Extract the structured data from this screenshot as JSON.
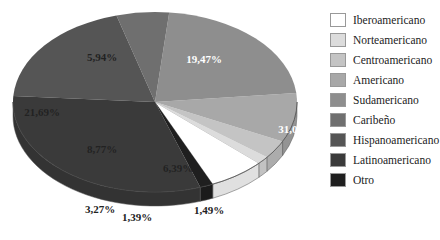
{
  "chart_data": {
    "type": "pie",
    "style": "3d",
    "title": "",
    "categories": [
      "Iberoamericano",
      "Norteamericano",
      "Centroamericano",
      "Americano",
      "Sudamericano",
      "Caribeño",
      "Hispanoamericano",
      "Latinoamericano",
      "Otro"
    ],
    "values": [
      6.39,
      1.39,
      3.27,
      8.77,
      21.69,
      5.94,
      19.47,
      31.05,
      1.49
    ],
    "labels": [
      "6,39%",
      "1,39%",
      "3,27%",
      "8,77%",
      "21,69%",
      "5,94%",
      "19,47%",
      "31,05%",
      "1,49%"
    ],
    "colors": [
      "#ffffff",
      "#dcdcdc",
      "#c4c4c4",
      "#a8a8a8",
      "#8e8e8e",
      "#6f6f6f",
      "#555555",
      "#3a3a3a",
      "#1f1f1f"
    ],
    "legend_position": "right"
  },
  "legend": {
    "items": [
      {
        "label": "Iberoamericano",
        "color": "#ffffff"
      },
      {
        "label": "Norteamericano",
        "color": "#dcdcdc"
      },
      {
        "label": "Centroamericano",
        "color": "#c4c4c4"
      },
      {
        "label": "Americano",
        "color": "#a8a8a8"
      },
      {
        "label": "Sudamericano",
        "color": "#8e8e8e"
      },
      {
        "label": "Caribeño",
        "color": "#6f6f6f"
      },
      {
        "label": "Hispanoamericano",
        "color": "#555555"
      },
      {
        "label": "Latinoamericano",
        "color": "#3a3a3a"
      },
      {
        "label": "Otro",
        "color": "#1f1f1f"
      }
    ]
  }
}
